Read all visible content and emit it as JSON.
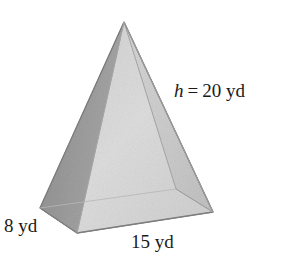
{
  "figure": {
    "name": "rectangular-pyramid",
    "unit": "yd"
  },
  "labels": {
    "height": {
      "variable": "h",
      "equals": "=",
      "value": "20 yd",
      "full": "h = 20 yd"
    },
    "depth": {
      "full": "8 yd",
      "value": "8",
      "unit": "yd"
    },
    "width": {
      "full": "15 yd",
      "value": "15",
      "unit": "yd"
    }
  },
  "colors": {
    "face_left_dark": "#9a9a9a",
    "face_front_light": "#dcdcdc",
    "face_right_mid": "#cfcfcf",
    "base_sliver": "#b4b4b4",
    "outline": "#8a8a8a",
    "edge_interior": "#b0b0b0",
    "text": "#1a1a1a",
    "background": "#ffffff"
  },
  "geometry": {
    "apex": [
      124,
      22
    ],
    "base_left": [
      40,
      208
    ],
    "base_front": [
      77,
      233
    ],
    "base_right": [
      213,
      212
    ],
    "base_back": [
      176,
      189
    ]
  }
}
